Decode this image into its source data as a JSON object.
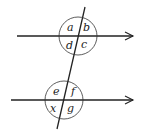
{
  "diagram": {
    "top_intersection": {
      "labels": {
        "top_left": "a",
        "top_right": "b",
        "bottom_left": "d",
        "bottom_right": "c"
      }
    },
    "bottom_intersection": {
      "labels": {
        "top_left": "e",
        "top_right": "f",
        "bottom_left": "x",
        "bottom_right": "g"
      }
    },
    "colors": {
      "stroke": "#222222",
      "background": "#ffffff"
    }
  }
}
